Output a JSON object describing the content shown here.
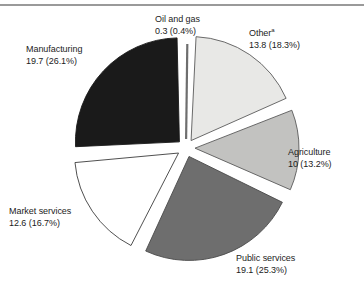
{
  "chart_data": {
    "type": "pie",
    "title": "",
    "subtitle": "",
    "xlabel": "",
    "ylabel": "",
    "legend": "none",
    "grid": false,
    "exploded": true,
    "total": 75.5,
    "unit": "",
    "categories": [
      "Oil and gas",
      "Other",
      "Agriculture",
      "Public services",
      "Market services",
      "Manufacturing"
    ],
    "values": [
      0.3,
      13.8,
      10,
      19.1,
      12.6,
      19.7
    ],
    "percentages": [
      0.4,
      18.3,
      13.2,
      25.3,
      16.7,
      26.1
    ],
    "slices": [
      {
        "name": "Oil and gas",
        "label": "Oil and gas",
        "value": 0.3,
        "value_text": "0.3",
        "percent": 0.4,
        "percent_text": "(0.4%)",
        "value_line": "0.3 (0.4%)",
        "color": "#8c8c8c",
        "stroke": "#6e6e6e",
        "footnote_marker": ""
      },
      {
        "name": "Other",
        "label": "Other",
        "value": 13.8,
        "value_text": "13.8",
        "percent": 18.3,
        "percent_text": "(18.3%)",
        "value_line": "13.8 (18.3%)",
        "color": "#e8e8e6",
        "stroke": "#5a5a5a",
        "footnote_marker": "a"
      },
      {
        "name": "Agriculture",
        "label": "Agriculture",
        "value": 10,
        "value_text": "10",
        "percent": 13.2,
        "percent_text": "(13.2%)",
        "value_line": "10 (13.2%)",
        "color": "#c2c2c0",
        "stroke": "#5a5a5a",
        "footnote_marker": ""
      },
      {
        "name": "Public services",
        "label": "Public services",
        "value": 19.1,
        "value_text": "19.1",
        "percent": 25.3,
        "percent_text": "(25.3%)",
        "value_line": "19.1 (25.3%)",
        "color": "#6e6e6e",
        "stroke": "#4a4a4a",
        "footnote_marker": ""
      },
      {
        "name": "Market services",
        "label": "Market services",
        "value": 12.6,
        "value_text": "12.6",
        "percent": 16.7,
        "percent_text": "(16.7%)",
        "value_line": "12.6 (16.7%)",
        "color": "#ffffff",
        "stroke": "#3c3c3c",
        "footnote_marker": ""
      },
      {
        "name": "Manufacturing",
        "label": "Manufacturing",
        "value": 19.7,
        "value_text": "19.7",
        "percent": 26.1,
        "percent_text": "(26.1%)",
        "value_line": "19.7 (26.1%)",
        "color": "#1a1a1a",
        "stroke": "#1a1a1a",
        "footnote_marker": ""
      }
    ]
  }
}
